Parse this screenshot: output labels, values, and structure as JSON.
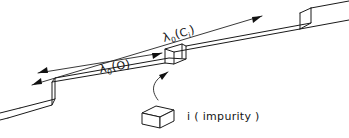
{
  "figure": {
    "kind": "hand-drawn-schematic",
    "background_color": "#ffffff",
    "ink_color": "#1a1a1a"
  },
  "labels": {
    "lambda_ci": {
      "lambda": "λ",
      "lambda_subscript": "0",
      "open_paren": "(",
      "species": "C",
      "species_subscript": "i",
      "close_paren": ")",
      "plain": "λ₀(Cᵢ)"
    },
    "lambda_o": {
      "lambda": "λ",
      "lambda_subscript": "0",
      "open_paren": "(",
      "species": "O",
      "close_paren": ")",
      "plain": "λ₀(O)"
    },
    "impurity": {
      "symbol": "i",
      "description": "( impurity )",
      "plain": "i ( impurity )"
    }
  },
  "annotations": {
    "dimension_lines": [
      {
        "name": "lambda-ci-dimension",
        "label": "λ₀(Cᵢ)",
        "arrow_ends": "both",
        "direction": "up-right"
      },
      {
        "name": "lambda-o-dimension",
        "label": "λ₀(O)",
        "arrow_ends": "both",
        "direction": "up-right"
      }
    ],
    "pointer": {
      "name": "impurity-pointer",
      "target": "step-riser",
      "style": "curved-arrow"
    }
  },
  "geometry": {
    "terrace_steps": 2,
    "ribbon_incline": "rising left-to-right",
    "impurity_shape": "parallelepiped"
  }
}
